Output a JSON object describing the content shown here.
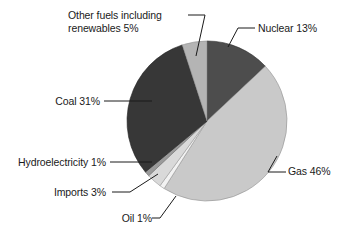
{
  "figure": {
    "background_color": "#ffffff",
    "width": 340,
    "height": 247
  },
  "chart_data": {
    "type": "pie",
    "title": "",
    "subtitle": "",
    "xlabel": "",
    "ylabel": "",
    "legend_position": "none",
    "grid": false,
    "label_style": "callout-leader-lines",
    "start_angle_deg": 0,
    "direction": "clockwise",
    "units": "percent",
    "total": 100,
    "categories": [
      "Nuclear",
      "Gas",
      "Oil",
      "Imports",
      "Hydroelectricity",
      "Coal",
      "Other fuels including renewables"
    ],
    "values": [
      13,
      46,
      1,
      3,
      1,
      31,
      5
    ],
    "labels": [
      "Nuclear 13%",
      "Gas 46%",
      "Oil 1%",
      "Imports 3%",
      "Hydroelectricity 1%",
      "Coal 31%",
      "Other fuels including renewables 5%"
    ],
    "colors": [
      "#4d4d4d",
      "#c9c9c9",
      "#f2f2f2",
      "#d9d9d9",
      "#9a9a9a",
      "#373737",
      "#b4b4b4"
    ],
    "slices": [
      {
        "name": "Nuclear",
        "value": 13,
        "label": "Nuclear 13%",
        "color": "#4d4d4d"
      },
      {
        "name": "Gas",
        "value": 46,
        "label": "Gas 46%",
        "color": "#c9c9c9"
      },
      {
        "name": "Oil",
        "value": 1,
        "label": "Oil 1%",
        "color": "#f2f2f2"
      },
      {
        "name": "Imports",
        "value": 3,
        "label": "Imports 3%",
        "color": "#d9d9d9"
      },
      {
        "name": "Hydroelectricity",
        "value": 1,
        "label": "Hydroelectricity 1%",
        "color": "#9a9a9a"
      },
      {
        "name": "Coal",
        "value": 31,
        "label": "Coal 31%",
        "color": "#373737"
      },
      {
        "name": "Other fuels including renewables",
        "value": 5,
        "label": "Other fuels including renewables 5%",
        "color": "#b4b4b4"
      }
    ]
  },
  "labels": {
    "other_fuels": "Other fuels including renewables 5%",
    "nuclear": "Nuclear 13%",
    "gas": "Gas 46%",
    "coal": "Coal 31%",
    "hydroelectricity": "Hydroelectricity 1%",
    "imports": "Imports 3%",
    "oil": "Oil 1%"
  }
}
